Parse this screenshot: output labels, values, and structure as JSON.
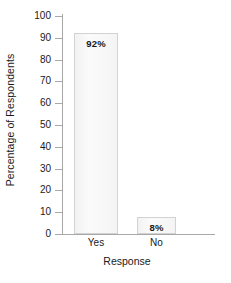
{
  "chart_data": {
    "type": "bar",
    "title": "",
    "categories": [
      "Yes",
      "No"
    ],
    "values": [
      92,
      8
    ],
    "data_labels": [
      "92%",
      "8%"
    ],
    "xlabel": "Response",
    "ylabel": "Percentage of Respondents",
    "ylim": [
      0,
      100
    ],
    "ytick_labels": [
      "0",
      "10",
      "20",
      "30",
      "40",
      "50",
      "60",
      "70",
      "80",
      "90",
      "100"
    ],
    "ytick_values": [
      0,
      10,
      20,
      30,
      40,
      50,
      60,
      70,
      80,
      90,
      100
    ],
    "grid": false,
    "legend": false,
    "legend_position": "none",
    "bar_fill_color": "#f7f7f7",
    "bar_border_color": "#d2d2d2",
    "axis_color": "#a8a8a8",
    "text_color": "#1a1a1a",
    "data_label_color": "#16181d"
  }
}
